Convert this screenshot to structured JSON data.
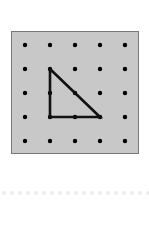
{
  "page": {
    "background_color": "#ffffff",
    "width": 149,
    "height": 227
  },
  "geoboard": {
    "name": "geoboard-panel",
    "fill_color": "#c8c8c8",
    "border_color": "#787878",
    "border_width": 1,
    "position": {
      "x": 11,
      "y": 31
    },
    "size": {
      "width": 128,
      "height": 123
    },
    "grid": {
      "rows": 5,
      "columns": 5,
      "dot_color": "#000000",
      "dot_radius": 2.2,
      "origin": {
        "x": 14,
        "y": 14
      },
      "spacing_x": 25,
      "spacing_y": 24,
      "peg_points": [
        [
          14,
          14
        ],
        [
          39,
          14
        ],
        [
          64,
          14
        ],
        [
          89,
          14
        ],
        [
          114,
          14
        ],
        [
          14,
          38
        ],
        [
          39,
          38
        ],
        [
          64,
          38
        ],
        [
          89,
          38
        ],
        [
          114,
          38
        ],
        [
          14,
          62
        ],
        [
          39,
          62
        ],
        [
          64,
          62
        ],
        [
          89,
          62
        ],
        [
          114,
          62
        ],
        [
          14,
          86
        ],
        [
          39,
          86
        ],
        [
          64,
          86
        ],
        [
          89,
          86
        ],
        [
          114,
          86
        ],
        [
          14,
          110
        ],
        [
          39,
          110
        ],
        [
          64,
          110
        ],
        [
          89,
          110
        ],
        [
          114,
          110
        ]
      ]
    },
    "shape": {
      "name": "right-triangle",
      "type": "polygon",
      "stroke_color": "#111111",
      "stroke_width": 2.6,
      "fill": "none",
      "vertices": [
        {
          "label": "apex",
          "grid": [
            1,
            1
          ],
          "x": 39,
          "y": 38
        },
        {
          "label": "right-angle",
          "grid": [
            1,
            3
          ],
          "x": 39,
          "y": 86
        },
        {
          "label": "base-end",
          "grid": [
            3,
            3
          ],
          "x": 89,
          "y": 86
        }
      ],
      "points_attr": "39,38 39,86 89,86 39,38"
    }
  },
  "bottom_rule": {
    "name": "bottom-dot-rule",
    "dot_color": "#eceded",
    "dot_radius": 2,
    "dot_count": 19,
    "start_x": 4,
    "spacing": 8,
    "center_y": 4
  }
}
